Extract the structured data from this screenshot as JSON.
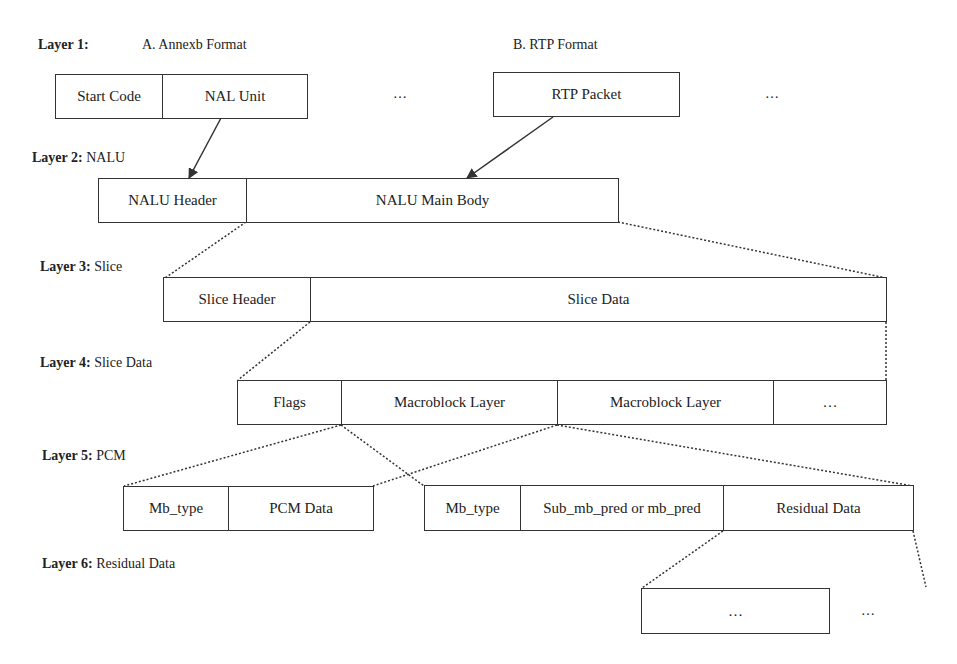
{
  "layers": [
    {
      "prefix": "Layer 1:",
      "name": "",
      "subtitles": [
        "A. Annexb Format",
        "B. RTP Format"
      ]
    },
    {
      "prefix": "Layer 2:",
      "name": "NALU"
    },
    {
      "prefix": "Layer 3:",
      "name": "Slice"
    },
    {
      "prefix": "Layer 4:",
      "name": "Slice Data"
    },
    {
      "prefix": "Layer 5:",
      "name": "PCM"
    },
    {
      "prefix": "Layer 6:",
      "name": "Residual Data"
    }
  ],
  "boxes": {
    "annexb": [
      "Start Code",
      "NAL Unit"
    ],
    "annexb_more": "…",
    "rtp": [
      "RTP Packet"
    ],
    "rtp_more": "…",
    "nalu": [
      "NALU Header",
      "NALU Main Body"
    ],
    "slice": [
      "Slice Header",
      "Slice Data"
    ],
    "slice_data": [
      "Flags",
      "Macroblock Layer",
      "Macroblock Layer",
      "…"
    ],
    "pcm": [
      "Mb_type",
      "PCM Data"
    ],
    "macroblock": [
      "Mb_type",
      "Sub_mb_pred or mb_pred",
      "Residual Data"
    ],
    "residual": [
      "…"
    ],
    "residual_more": "…"
  },
  "colors": {
    "line": "#333333",
    "background": "#ffffff"
  }
}
